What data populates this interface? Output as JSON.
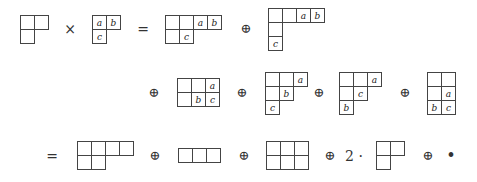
{
  "diagram": {
    "cell_size": 15,
    "operators": [
      {
        "id": "times",
        "symbol": "×",
        "x": 70,
        "y": 29
      },
      {
        "id": "eq1",
        "symbol": "=",
        "x": 143,
        "y": 29
      },
      {
        "id": "plus1",
        "symbol": "⊕",
        "x": 246,
        "y": 29
      },
      {
        "id": "plus2",
        "symbol": "⊕",
        "x": 154,
        "y": 93
      },
      {
        "id": "plus3",
        "symbol": "⊕",
        "x": 242,
        "y": 93
      },
      {
        "id": "plus4",
        "symbol": "⊕",
        "x": 319,
        "y": 93
      },
      {
        "id": "plus5",
        "symbol": "⊕",
        "x": 405,
        "y": 93
      },
      {
        "id": "eq2",
        "symbol": "=",
        "x": 52,
        "y": 156
      },
      {
        "id": "plus6",
        "symbol": "⊕",
        "x": 155,
        "y": 156
      },
      {
        "id": "plus7",
        "symbol": "⊕",
        "x": 244,
        "y": 156
      },
      {
        "id": "plus8",
        "symbol": "⊕",
        "x": 330,
        "y": 156
      },
      {
        "id": "coef2",
        "symbol": "2 ·",
        "x": 354,
        "y": 156
      },
      {
        "id": "plus9",
        "symbol": "⊕",
        "x": 428,
        "y": 156
      },
      {
        "id": "bullet",
        "symbol": "•",
        "x": 451,
        "y": 156
      }
    ],
    "tableaux": [
      {
        "id": "lambda",
        "x": 20,
        "y": 15,
        "rows": [
          [
            "",
            ""
          ],
          [
            ""
          ]
        ]
      },
      {
        "id": "mu",
        "x": 92,
        "y": 15,
        "rows": [
          [
            "a",
            "b"
          ],
          [
            "c"
          ]
        ]
      },
      {
        "id": "t1",
        "x": 165,
        "y": 15,
        "rows": [
          [
            "",
            "",
            "a",
            "b"
          ],
          [
            "",
            "c"
          ]
        ]
      },
      {
        "id": "t2",
        "x": 268,
        "y": 8,
        "rows": [
          [
            "",
            "",
            "a",
            "b"
          ],
          [
            ""
          ],
          [
            "c"
          ]
        ]
      },
      {
        "id": "t3",
        "x": 177,
        "y": 78,
        "rows": [
          [
            "",
            "",
            "a"
          ],
          [
            "",
            "b",
            "c"
          ]
        ]
      },
      {
        "id": "t4",
        "x": 265,
        "y": 72,
        "rows": [
          [
            "",
            "",
            "a"
          ],
          [
            "",
            "b"
          ],
          [
            "c"
          ]
        ]
      },
      {
        "id": "t5",
        "x": 339,
        "y": 72,
        "rows": [
          [
            "",
            "",
            "a"
          ],
          [
            "",
            "c"
          ],
          [
            "b"
          ]
        ]
      },
      {
        "id": "t6",
        "x": 427,
        "y": 72,
        "rows": [
          [
            "",
            ""
          ],
          [
            "",
            "a"
          ],
          [
            "b",
            "c"
          ]
        ]
      },
      {
        "id": "s1",
        "x": 77,
        "y": 141,
        "rows": [
          [
            "",
            "",
            "",
            ""
          ],
          [
            "",
            ""
          ]
        ]
      },
      {
        "id": "s2",
        "x": 178,
        "y": 148,
        "rows": [
          [
            "",
            "",
            ""
          ]
        ]
      },
      {
        "id": "s3",
        "x": 266,
        "y": 141,
        "rows": [
          [
            "",
            "",
            ""
          ],
          [
            "",
            "",
            ""
          ]
        ]
      },
      {
        "id": "s4",
        "x": 376,
        "y": 141,
        "rows": [
          [
            "",
            ""
          ],
          [
            ""
          ]
        ]
      }
    ]
  }
}
